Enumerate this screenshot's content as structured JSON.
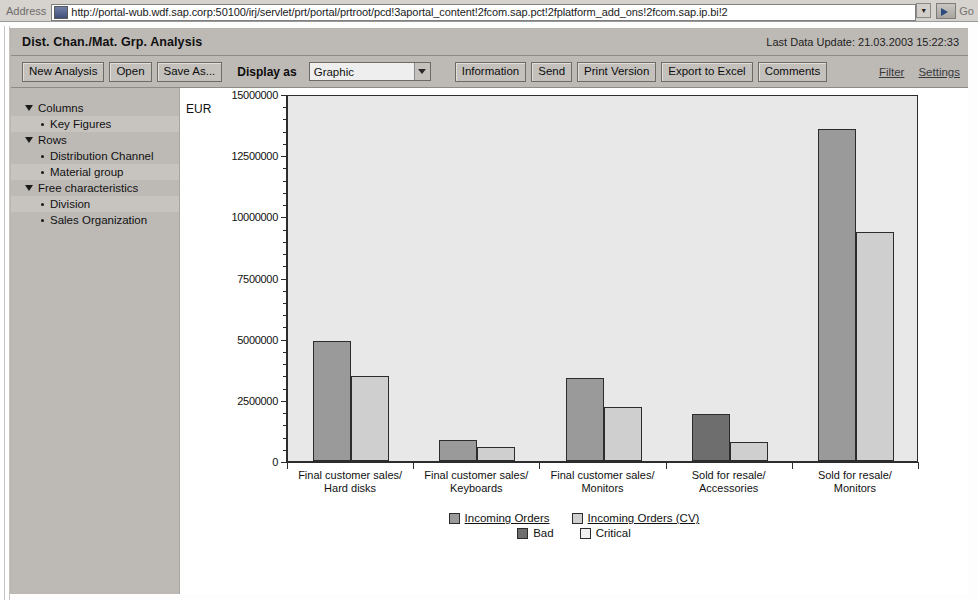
{
  "browser": {
    "address_label": "Address",
    "url": "http://portal-wub.wdf.sap.corp:50100/irj/servlet/prt/portal/prtroot/pcd!3aportal_content!2fcom.sap.pct!2fplatform_add_ons!2fcom.sap.ip.bi!2",
    "go_label": "Go"
  },
  "header": {
    "title": "Dist. Chan./Mat. Grp. Analysis",
    "last_update": "Last Data Update: 21.03.2003 15:22:33"
  },
  "toolbar": {
    "new_analysis": "New Analysis",
    "open": "Open",
    "save_as": "Save As...",
    "display_as_label": "Display as",
    "display_as_value": "Graphic",
    "display_as_options": [
      "Graphic",
      "Table"
    ],
    "information": "Information",
    "send": "Send",
    "print_version": "Print Version",
    "export_to_excel": "Export to Excel",
    "comments": "Comments",
    "filter": "Filter",
    "settings": "Settings"
  },
  "navigation": {
    "groups": [
      {
        "label": "Columns",
        "items": [
          {
            "label": "Key Figures"
          }
        ]
      },
      {
        "label": "Rows",
        "items": [
          {
            "label": "Distribution Channel"
          },
          {
            "label": "Material group"
          }
        ]
      },
      {
        "label": "Free characteristics",
        "items": [
          {
            "label": "Division"
          },
          {
            "label": "Sales Organization"
          }
        ]
      }
    ]
  },
  "chart_data": {
    "type": "bar",
    "title": "",
    "xlabel": "",
    "ylabel": "EUR",
    "unit_label": "EUR",
    "ylim": [
      0,
      15000000
    ],
    "ytick_values": [
      0,
      2500000,
      5000000,
      7500000,
      10000000,
      12500000,
      15000000
    ],
    "ytick_labels": [
      "0",
      "2500000",
      "5000000",
      "7500000",
      "10000000",
      "12500000",
      "15000000"
    ],
    "grid": false,
    "legend_position": "bottom",
    "categories": [
      "Final customer sales/\nHard disks",
      "Final customer sales/\nKeyboards",
      "Final customer sales/\nMonitors",
      "Sold for resale/\nAccessories",
      "Sold for resale/\nMonitors"
    ],
    "category_lines": [
      [
        "Final customer sales/",
        "Hard disks"
      ],
      [
        "Final customer sales/",
        "Keyboards"
      ],
      [
        "Final customer sales/",
        "Monitors"
      ],
      [
        "Sold for resale/",
        "Accessories"
      ],
      [
        "Sold for resale/",
        "Monitors"
      ]
    ],
    "series": [
      {
        "name": "Incoming Orders",
        "color": "#9a9a9a",
        "values": [
          4890000,
          860000,
          3410000,
          1930000,
          13560000
        ],
        "alert_colors": [
          null,
          null,
          null,
          "#6e6e6e",
          null
        ]
      },
      {
        "name": "Incoming Orders (CV)",
        "color": "#cfcfcf",
        "values": [
          3490000,
          580000,
          2220000,
          780000,
          9370000
        ],
        "alert_colors": [
          null,
          null,
          null,
          null,
          null
        ]
      }
    ],
    "legend": [
      {
        "label": "Incoming Orders",
        "color": "#9a9a9a",
        "link": true
      },
      {
        "label": "Incoming Orders (CV)",
        "color": "#cfcfcf",
        "link": true
      },
      {
        "label": "Bad",
        "color": "#6e6e6e",
        "link": false
      },
      {
        "label": "Critical",
        "color": "#f0f0f0",
        "link": false
      }
    ]
  }
}
